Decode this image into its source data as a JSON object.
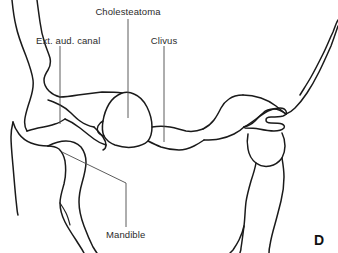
{
  "figure": {
    "panel_letter": "D",
    "background_color": "#ffffff",
    "stroke_color": "#1a1a1a",
    "leader_color": "#4a4a4a",
    "label_color": "#2b2b2b",
    "width": 338,
    "height": 253
  },
  "labels": {
    "cholesteatoma": "Cholesteatoma",
    "ext_aud_canal": "Ext. aud. canal",
    "clivus": "Clivus",
    "mandible": "Mandible"
  }
}
